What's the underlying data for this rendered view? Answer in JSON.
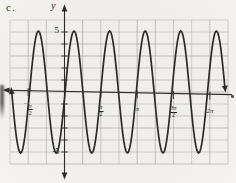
{
  "labels": {
    "item": "c."
  },
  "chart_data": {
    "type": "line",
    "title": "",
    "function": "y = 5*sin(4x)",
    "amplitude": 5,
    "angular_frequency": 4,
    "period": "pi/2",
    "ylabel": "y",
    "xlabel": "",
    "x_tick_labels": [
      "-π/2",
      "π/2",
      "π",
      "3π/2",
      "2π"
    ],
    "x_tick_values_pi": [
      -0.5,
      0.5,
      1,
      1.5,
      2
    ],
    "y_axis_labels": {
      "max": "5",
      "min": "-5"
    },
    "y_axis_label_values": [
      5,
      -5
    ],
    "xlim_pi": [
      -0.75,
      2.25
    ],
    "ylim": [
      -6,
      6
    ],
    "grid": true,
    "x_grid_step_pi": 0.25,
    "y_grid_step": 1,
    "key_points": {
      "peaks_x_pi": [
        -0.375,
        0.125,
        0.625,
        1.125,
        1.625,
        2.125
      ],
      "peak_y": 5,
      "troughs_x_pi": [
        -0.625,
        -0.125,
        0.375,
        0.875,
        1.375,
        1.875
      ],
      "trough_y": -5,
      "y_intercept": 0
    },
    "legend": null,
    "layout": {
      "width": 236,
      "height": 183,
      "origin": {
        "x": 64.5,
        "y": 92
      },
      "px_per_pi": 72.7,
      "px_per_y_unit": 12.2,
      "grid": {
        "x0": 10,
        "y0": 20,
        "cols": 12,
        "rows": 12,
        "dx": 18.167,
        "dy": 12
      },
      "y_axis": {
        "x": 64.5,
        "top": 9,
        "bottom": 175
      },
      "x_axis": {
        "x_start": 7,
        "y_start": 90.2,
        "x_end": 232,
        "y_end": 94.6
      },
      "curve": {
        "x_start": 11.7,
        "x_end": 224.8,
        "phase_px": 65.1,
        "period_px": 35.6,
        "amp_px": 61,
        "mid_py": 92
      },
      "y_tick_rows": [
        32,
        44,
        56,
        68,
        80,
        104,
        116,
        128,
        140,
        152
      ]
    }
  },
  "style": {
    "paper": "#efeeea",
    "grid_color": "#a5a29c",
    "ink": "#2b2b28",
    "curve_width": 1.7
  }
}
